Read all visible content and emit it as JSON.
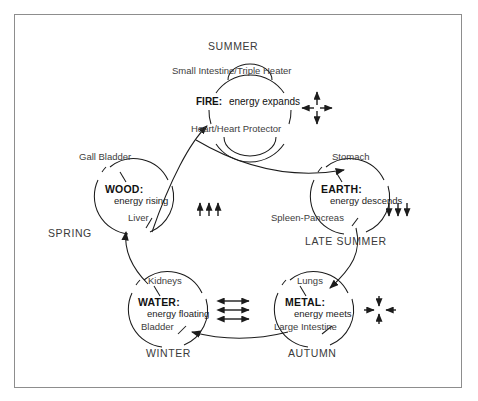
{
  "diagram": {
    "type": "cycle-diagram",
    "frame_color": "#8d8d8d",
    "line_color": "#1c1c1c",
    "elements": [
      {
        "id": "fire",
        "name": "FIRE:",
        "description": "energy expands",
        "season": "SUMMER",
        "yang_organ": "Small Intestine/Triple Heater",
        "yin_organ": "Heart/Heart Protector",
        "motion": "expands",
        "symbol": "four-arrows-outward"
      },
      {
        "id": "earth",
        "name": "EARTH:",
        "description": "energy descends",
        "season": "LATE SUMMER",
        "yang_organ": "Stomach",
        "yin_organ": "Spleen-Pancreas",
        "motion": "descends",
        "symbol": "three-arrows-down"
      },
      {
        "id": "metal",
        "name": "METAL:",
        "description": "energy meets",
        "season": "AUTUMN",
        "yang_organ": "Lungs",
        "yin_organ": "Large Intestine",
        "motion": "meets",
        "symbol": "four-arrows-inward"
      },
      {
        "id": "water",
        "name": "WATER:",
        "description": "energy floating",
        "season": "WINTER",
        "yang_organ": "Kidneys",
        "yin_organ": "Bladder",
        "motion": "floating",
        "symbol": "three-arrows-horizontal-double"
      },
      {
        "id": "wood",
        "name": "WOOD:",
        "description": "energy rising",
        "season": "SPRING",
        "yang_organ": "Gall Bladder",
        "yin_organ": "Liver",
        "motion": "rising",
        "symbol": "three-arrows-up"
      }
    ],
    "cycle_order": [
      "wood",
      "fire",
      "earth",
      "metal",
      "water",
      "wood"
    ]
  }
}
